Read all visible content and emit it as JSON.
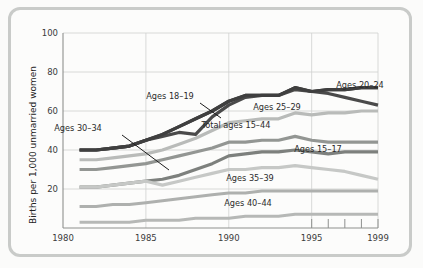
{
  "chart_data": {
    "type": "line",
    "title": "",
    "xlabel": "",
    "ylabel": "Births per 1,000 unmarried women",
    "xlim": [
      1980,
      1999
    ],
    "ylim": [
      0,
      100
    ],
    "grid": true,
    "legend_position": "inline-annotations",
    "x": [
      1981,
      1982,
      1983,
      1984,
      1985,
      1986,
      1987,
      1988,
      1989,
      1990,
      1991,
      1992,
      1993,
      1994,
      1995,
      1996,
      1997,
      1998,
      1999
    ],
    "y_ticks": [
      20,
      40,
      60,
      80,
      100
    ],
    "x_ticks": [
      1980,
      1985,
      1990,
      1995,
      1999
    ],
    "x_minor_ticks": [
      1996,
      1997,
      1998
    ],
    "series": [
      {
        "name": "Ages 20-24",
        "label": "Ages 20–24",
        "color": "#3b3b3b",
        "width": 3.2,
        "label_x": 360,
        "label_y": 88,
        "values": [
          40,
          40,
          41,
          42,
          45,
          48,
          52,
          56,
          60,
          65,
          68,
          68,
          68,
          72,
          70,
          71,
          71,
          72,
          72
        ]
      },
      {
        "name": "Ages 18-19",
        "label": "Ages 18–19",
        "color": "#4a4a4a",
        "width": 3.2,
        "label_x": 170,
        "label_y": 99,
        "leader": [
          [
            200,
            103
          ],
          [
            221,
            118
          ]
        ],
        "values": [
          40,
          40,
          41,
          42,
          45,
          47,
          49,
          48,
          57,
          63,
          67,
          68,
          68,
          71,
          70,
          69,
          67,
          65,
          63
        ]
      },
      {
        "name": "Ages 25-29",
        "label": "Ages 25–29",
        "color": "#3f3f3f",
        "width": 3.2,
        "label_x": 277,
        "label_y": 110,
        "values": [
          40,
          40,
          41,
          42,
          45,
          48,
          52,
          56,
          60,
          65,
          68,
          68,
          68,
          72,
          70,
          71,
          71,
          72,
          72
        ]
      },
      {
        "name": "Total ages 15-44",
        "label": "Total ages 15–44",
        "color": "#b9bbb9",
        "width": 3.2,
        "label_x": 236,
        "label_y": 128,
        "values": [
          35,
          35,
          36,
          37,
          38,
          40,
          43,
          46,
          50,
          54,
          55,
          56,
          56,
          59,
          58,
          59,
          59,
          60,
          60
        ]
      },
      {
        "name": "Ages 30-34",
        "label": "Ages 30–34",
        "color": "#939693",
        "width": 3.2,
        "label_x": 78,
        "label_y": 131,
        "leader": [
          [
            122,
            135
          ],
          [
            169,
            170
          ]
        ],
        "values": [
          30,
          30,
          31,
          32,
          33,
          35,
          37,
          39,
          41,
          44,
          44,
          45,
          45,
          47,
          45,
          44,
          44,
          44,
          44
        ]
      },
      {
        "name": "Ages 15-17",
        "label": "Ages 15–17",
        "color": "#7d807d",
        "width": 3.2,
        "label_x": 318,
        "label_y": 152,
        "values": [
          21,
          21,
          22,
          23,
          24,
          25,
          27,
          30,
          33,
          37,
          38,
          39,
          39,
          40,
          39,
          38,
          39,
          39,
          39
        ]
      },
      {
        "name": "Ages 35-39",
        "label": "Ages 35–39",
        "color": "#c6c8c6",
        "width": 3.2,
        "label_x": 250,
        "label_y": 181,
        "values": [
          21,
          21,
          22,
          23,
          24,
          22,
          24,
          26,
          28,
          30,
          30,
          31,
          31,
          32,
          31,
          30,
          29,
          27,
          25
        ]
      },
      {
        "name": "Ages 40-44",
        "label": "Ages 40–44",
        "color": "#aeb0ae",
        "width": 3.0,
        "label_x": 248,
        "label_y": 206,
        "values": [
          11,
          11,
          12,
          12,
          13,
          14,
          15,
          16,
          17,
          18,
          18,
          19,
          19,
          19,
          19,
          19,
          19,
          19,
          19
        ]
      },
      {
        "name": "lowest-band",
        "label": "",
        "color": "#b6b8b6",
        "width": 3.0,
        "values": [
          3,
          3,
          3,
          3,
          4,
          4,
          4,
          5,
          5,
          5,
          6,
          6,
          6,
          7,
          7,
          7,
          7,
          7,
          7
        ]
      }
    ]
  },
  "axis": {
    "y_title": "Births per 1,000 unmarried women",
    "y_tick_labels": [
      "100",
      "80",
      "60",
      "40",
      "20"
    ],
    "x_tick_labels": [
      "1980",
      "1985",
      "1990",
      "1995",
      "1999"
    ]
  }
}
